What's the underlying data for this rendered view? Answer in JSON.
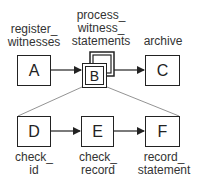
{
  "diagram": {
    "top_row": [
      {
        "id": "A",
        "label_line1": "register_",
        "label_line2": "witnesses"
      },
      {
        "id": "B",
        "label_line1": "process_",
        "label_line2": "witness_",
        "label_line3": "statements"
      },
      {
        "id": "C",
        "label_line1": "archive"
      }
    ],
    "bottom_row": [
      {
        "id": "D",
        "label_line1": "check_",
        "label_line2": "id"
      },
      {
        "id": "E",
        "label_line1": "check_",
        "label_line2": "record"
      },
      {
        "id": "F",
        "label_line1": "record_",
        "label_line2": "statement"
      }
    ],
    "edges": [
      [
        "A",
        "B"
      ],
      [
        "B",
        "C"
      ],
      [
        "D",
        "E"
      ],
      [
        "E",
        "F"
      ]
    ],
    "expansion": {
      "parent": "B",
      "children": [
        "D",
        "E",
        "F"
      ]
    }
  }
}
